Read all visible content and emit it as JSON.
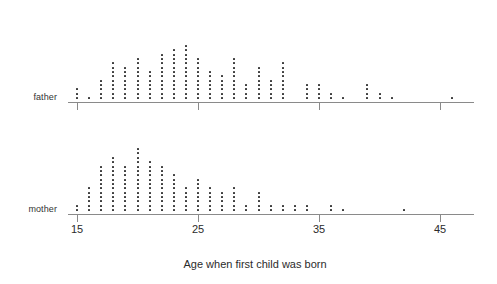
{
  "labels": {
    "father": "father",
    "mother": "mother",
    "xlabel": "Age when first child was born"
  },
  "axis": {
    "ticks": [
      "15",
      "25",
      "35",
      "45"
    ],
    "tick_values": [
      15,
      25,
      35,
      45
    ]
  },
  "chart_data": {
    "type": "scatter",
    "subtype": "dotplot",
    "title": "",
    "subtitle": "",
    "xlabel": "Age when first child was born",
    "ylabel": "",
    "xlim": [
      14,
      48
    ],
    "xticks": [
      15,
      25,
      35,
      45
    ],
    "xticklabels": [
      "15",
      "25",
      "35",
      "45"
    ],
    "grid": false,
    "legend": "none",
    "dot_unit": 1,
    "series": [
      {
        "name": "father",
        "x": [
          15,
          16,
          17,
          18,
          19,
          20,
          21,
          22,
          23,
          24,
          25,
          26,
          27,
          28,
          29,
          30,
          31,
          32,
          34,
          35,
          36,
          37,
          39,
          40,
          41,
          46
        ],
        "values": [
          3,
          1,
          5,
          9,
          8,
          10,
          7,
          11,
          12,
          13,
          10,
          7,
          6,
          10,
          4,
          8,
          5,
          9,
          4,
          4,
          2,
          1,
          4,
          2,
          1,
          1
        ]
      },
      {
        "name": "mother",
        "x": [
          15,
          16,
          17,
          18,
          19,
          20,
          21,
          22,
          23,
          24,
          25,
          26,
          27,
          28,
          29,
          30,
          31,
          32,
          33,
          34,
          36,
          37,
          42
        ],
        "values": [
          2,
          6,
          11,
          13,
          11,
          15,
          12,
          11,
          9,
          6,
          8,
          6,
          5,
          6,
          2,
          5,
          2,
          2,
          2,
          2,
          2,
          1,
          1
        ]
      }
    ]
  }
}
